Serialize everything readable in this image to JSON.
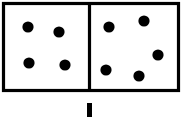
{
  "figure": {
    "type": "domino",
    "background_color": "#ffffff",
    "ink_color": "#000000",
    "width": 183,
    "height": 119
  },
  "domino": {
    "label": "domino-tile",
    "total_pips": 9,
    "frame": {
      "x": 3.5,
      "y": 3.5,
      "width": 175,
      "height": 87,
      "stroke_width": 3.2,
      "stroke_color": "#000000",
      "fill_color": "#ffffff"
    },
    "divider": {
      "x": 89.5,
      "y1": 3.5,
      "y2": 90.5,
      "stroke_width": 3.2,
      "stroke_color": "#000000"
    },
    "pip_radius": 5.6,
    "pip_color": "#000000",
    "halves": [
      {
        "name": "left-half",
        "pip_count": 4,
        "pips": [
          {
            "cx": 28,
            "cy": 27
          },
          {
            "cx": 59,
            "cy": 32
          },
          {
            "cx": 29,
            "cy": 63
          },
          {
            "cx": 65,
            "cy": 65
          }
        ]
      },
      {
        "name": "right-half",
        "pip_count": 5,
        "pips": [
          {
            "cx": 109,
            "cy": 27
          },
          {
            "cx": 144,
            "cy": 21
          },
          {
            "cx": 158,
            "cy": 55
          },
          {
            "cx": 106,
            "cy": 70
          },
          {
            "cx": 139,
            "cy": 76
          }
        ]
      }
    ]
  },
  "tick_mark": {
    "label": "center-tick-mark",
    "x": 87,
    "y": 103,
    "width": 5,
    "height": 14,
    "color": "#000000"
  }
}
